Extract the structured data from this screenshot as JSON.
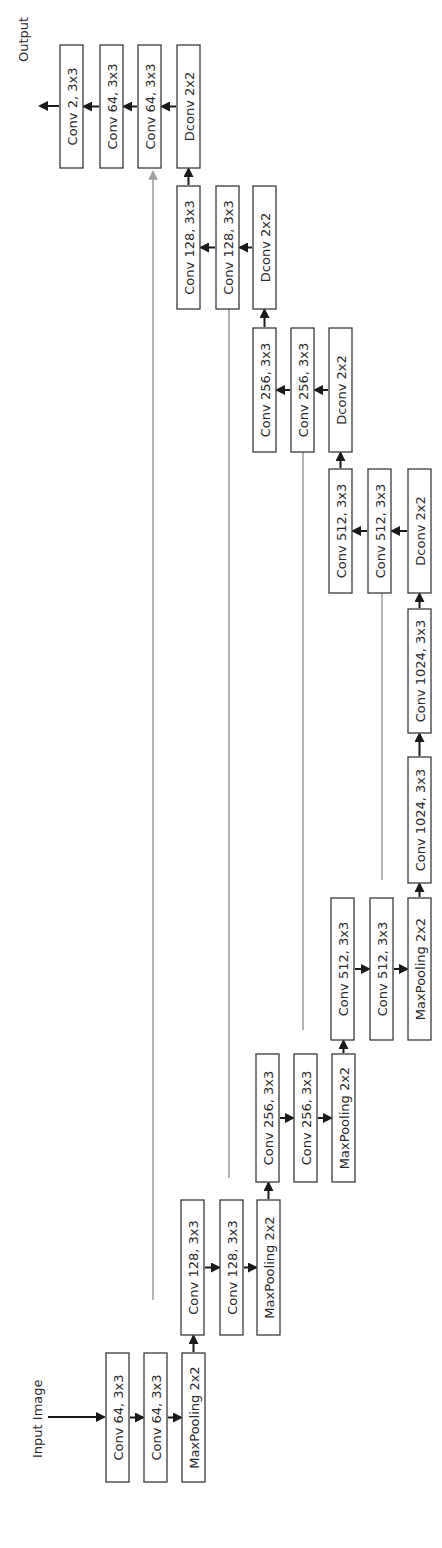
{
  "labels": {
    "input": "Input Image",
    "output": "Output"
  },
  "colors": {
    "box_stroke": "#3a3a3a",
    "arrow": "#1a1a1a",
    "skip": "#a0a0a0"
  },
  "boxes": [
    {
      "id": "enc1_conv1",
      "label": "Conv 64, 3x3",
      "x": 106,
      "y": 1353,
      "w": 23,
      "h": 129
    },
    {
      "id": "enc1_conv2",
      "label": "Conv 64, 3x3",
      "x": 144,
      "y": 1353,
      "w": 23,
      "h": 129
    },
    {
      "id": "enc1_pool",
      "label": "MaxPooling 2x2",
      "x": 182,
      "y": 1353,
      "w": 23,
      "h": 129
    },
    {
      "id": "enc2_conv1",
      "label": "Conv 128, 3x3",
      "x": 181,
      "y": 1200,
      "w": 23,
      "h": 135
    },
    {
      "id": "enc2_conv2",
      "label": "Conv 128, 3x3",
      "x": 220,
      "y": 1200,
      "w": 23,
      "h": 135
    },
    {
      "id": "enc2_pool",
      "label": "MaxPooling 2x2",
      "x": 257,
      "y": 1200,
      "w": 23,
      "h": 135
    },
    {
      "id": "enc3_conv1",
      "label": "Conv 256, 3x3",
      "x": 256,
      "y": 1054,
      "w": 23,
      "h": 128
    },
    {
      "id": "enc3_conv2",
      "label": "Conv 256, 3x3",
      "x": 294,
      "y": 1054,
      "w": 23,
      "h": 128
    },
    {
      "id": "enc3_pool",
      "label": "MaxPooling 2x2",
      "x": 332,
      "y": 1054,
      "w": 23,
      "h": 128
    },
    {
      "id": "enc4_conv1",
      "label": "Conv 512, 3x3",
      "x": 331,
      "y": 898,
      "w": 23,
      "h": 142
    },
    {
      "id": "enc4_conv2",
      "label": "Conv 512, 3x3",
      "x": 370,
      "y": 898,
      "w": 23,
      "h": 142
    },
    {
      "id": "enc4_pool",
      "label": "MaxPooling 2x2",
      "x": 408,
      "y": 898,
      "w": 23,
      "h": 142
    },
    {
      "id": "bott_conv1",
      "label": "Conv 1024, 3x3",
      "x": 408,
      "y": 757,
      "w": 23,
      "h": 126
    },
    {
      "id": "bott_conv2",
      "label": "Conv 1024, 3x3",
      "x": 408,
      "y": 609,
      "w": 23,
      "h": 124
    },
    {
      "id": "dec4_dconv",
      "label": "Dconv 2x2",
      "x": 408,
      "y": 469,
      "w": 23,
      "h": 124
    },
    {
      "id": "dec4_conv2",
      "label": "Conv 512, 3x3",
      "x": 368,
      "y": 469,
      "w": 23,
      "h": 124
    },
    {
      "id": "dec4_conv1",
      "label": "Conv 512, 3x3",
      "x": 329,
      "y": 469,
      "w": 23,
      "h": 124
    },
    {
      "id": "dec3_dconv",
      "label": "Dconv 2x2",
      "x": 329,
      "y": 328,
      "w": 23,
      "h": 124
    },
    {
      "id": "dec3_conv2",
      "label": "Conv 256, 3x3",
      "x": 291,
      "y": 328,
      "w": 23,
      "h": 124
    },
    {
      "id": "dec3_conv1",
      "label": "Conv 256, 3x3",
      "x": 253,
      "y": 328,
      "w": 23,
      "h": 124
    },
    {
      "id": "dec2_dconv",
      "label": "Dconv 2x2",
      "x": 253,
      "y": 186,
      "w": 23,
      "h": 123
    },
    {
      "id": "dec2_conv2",
      "label": "Conv 128, 3x3",
      "x": 216,
      "y": 186,
      "w": 23,
      "h": 123
    },
    {
      "id": "dec2_conv1",
      "label": "Conv 128, 3x3",
      "x": 177,
      "y": 186,
      "w": 23,
      "h": 123
    },
    {
      "id": "dec1_dconv",
      "label": "Dconv 2x2",
      "x": 177,
      "y": 45,
      "w": 23,
      "h": 123
    },
    {
      "id": "dec1_conv2",
      "label": "Conv 64, 3x3",
      "x": 138,
      "y": 45,
      "w": 23,
      "h": 123
    },
    {
      "id": "dec1_conv1",
      "label": "Conv 64, 3x3",
      "x": 100,
      "y": 45,
      "w": 23,
      "h": 123
    },
    {
      "id": "out_conv",
      "label": "Conv 2, 3x3",
      "x": 60,
      "y": 45,
      "w": 23,
      "h": 123
    }
  ],
  "skip_connections": [
    {
      "from": "enc1_conv2",
      "to": "dec1_conv2",
      "x": 153,
      "y1": 1300,
      "y2": 172
    },
    {
      "from": "enc2_conv2",
      "to": "dec2_conv2",
      "x": 229,
      "y1": 1178,
      "y2": 297
    },
    {
      "from": "enc3_conv2",
      "to": "dec3_conv2",
      "x": 303,
      "y1": 1030,
      "y2": 420
    },
    {
      "from": "enc4_conv2",
      "to": "dec4_conv2",
      "x": 382,
      "y1": 880,
      "y2": 570
    }
  ]
}
